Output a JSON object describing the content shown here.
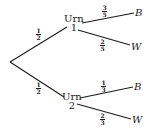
{
  "diagram": {
    "type": "probability-tree",
    "root_branches": [
      {
        "prob_num": "1",
        "prob_den": "2",
        "node_label": "Urn",
        "node_number": "1",
        "outcomes": [
          {
            "label": "B",
            "prob_num": "3",
            "prob_den": "5"
          },
          {
            "label": "W",
            "prob_num": "2",
            "prob_den": "5"
          }
        ]
      },
      {
        "prob_num": "1",
        "prob_den": "2",
        "node_label": "Urn",
        "node_number": "2",
        "outcomes": [
          {
            "label": "B",
            "prob_num": "1",
            "prob_den": "3"
          },
          {
            "label": "W",
            "prob_num": "2",
            "prob_den": "3"
          }
        ]
      }
    ],
    "colors": {
      "ink": "#1a1a1a",
      "background": "#ffffff"
    }
  }
}
